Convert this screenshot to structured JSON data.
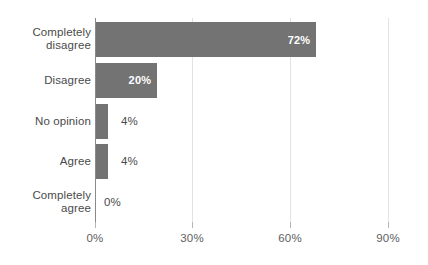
{
  "chart_data": {
    "type": "bar",
    "orientation": "horizontal",
    "title": "",
    "subtitle": "",
    "xlabel": "",
    "ylabel": "",
    "categories": [
      "Completely disagree",
      "Disagree",
      "No opinion",
      "Agree",
      "Completely agree"
    ],
    "category_lines": [
      [
        "Completely",
        "disagree"
      ],
      [
        "Disagree"
      ],
      [
        "No opinion"
      ],
      [
        "Agree"
      ],
      [
        "Completely",
        "agree"
      ]
    ],
    "values": [
      72,
      20,
      4,
      4,
      0
    ],
    "data_labels": [
      "72%",
      "20%",
      "4%",
      "4%",
      "0%"
    ],
    "label_placement": [
      "inside",
      "inside",
      "outside",
      "outside",
      "outside"
    ],
    "xlim": [
      0,
      100
    ],
    "xticks": [
      0,
      30,
      60,
      90
    ],
    "xtick_labels": [
      "0%",
      "30%",
      "60%",
      "90%"
    ],
    "grid": {
      "vertical": true,
      "horizontal": false
    },
    "legend": {
      "visible": false,
      "position": ""
    },
    "colors": {
      "bar": "#737373",
      "background": "#ffffff",
      "gridline": "#e2e2e2",
      "axis": "#8a8a8a",
      "category_text": "#4a4a4a",
      "tick_text": "#5e5e5e",
      "inside_label_text": "#ffffff",
      "outside_label_text": "#4a4a4a"
    }
  }
}
